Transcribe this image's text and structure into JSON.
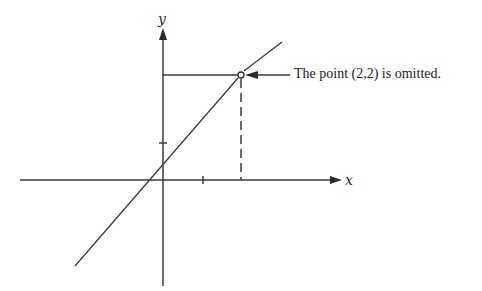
{
  "diagram": {
    "axes": {
      "x_label": "x",
      "y_label": "y"
    },
    "function": "y = x, with the point (2,2) removed",
    "ticks": {
      "x": [
        1,
        2
      ],
      "y": [
        1,
        2
      ]
    },
    "omitted_point": {
      "x": 2,
      "y": 2,
      "marker": "open-circle"
    },
    "annotation": "The point (2,2) is omitted.",
    "colors": {
      "stroke": "#3a3a3a",
      "background": "#ffffff"
    }
  }
}
